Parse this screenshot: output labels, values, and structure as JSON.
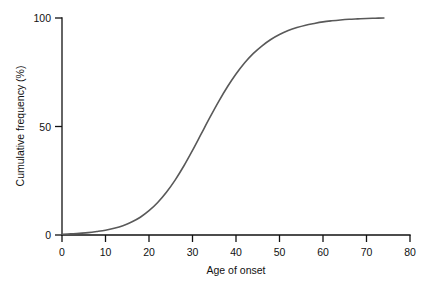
{
  "chart_data": {
    "type": "line",
    "title": "",
    "xlabel": "Age of onset",
    "ylabel": "Cumulative frequency (%)",
    "xlim": [
      0,
      80
    ],
    "ylim": [
      0,
      100
    ],
    "xticks": [
      0,
      10,
      20,
      30,
      40,
      50,
      60,
      70,
      80
    ],
    "xticklabels": [
      "0",
      "10",
      "20",
      "30",
      "40",
      "50",
      "60",
      "70",
      "80"
    ],
    "yticks": [
      0,
      50,
      100
    ],
    "yticklabels": [
      "0",
      "50",
      "100"
    ],
    "grid": false,
    "legend": false,
    "series": [
      {
        "name": "Cumulative frequency",
        "color": "#595959",
        "x": [
          0,
          2,
          4,
          6,
          8,
          10,
          12,
          14,
          16,
          18,
          20,
          22,
          24,
          26,
          28,
          30,
          32,
          34,
          36,
          38,
          40,
          42,
          44,
          46,
          48,
          50,
          52,
          54,
          56,
          58,
          60,
          62,
          64,
          66,
          68,
          70,
          72,
          74
        ],
        "y": [
          0.3,
          0.5,
          0.8,
          1.1,
          1.6,
          2.2,
          3.1,
          4.3,
          6.0,
          8.2,
          11.2,
          15.0,
          19.7,
          25.3,
          31.8,
          39.0,
          46.6,
          54.2,
          61.5,
          68.2,
          74.2,
          79.4,
          83.7,
          87.2,
          90.1,
          92.4,
          94.2,
          95.6,
          96.7,
          97.5,
          98.2,
          98.7,
          99.1,
          99.4,
          99.6,
          99.8,
          99.9,
          100.0
        ]
      }
    ],
    "annotations": []
  },
  "axis_colors": {
    "axis": "#111111",
    "curve": "#595959",
    "background": "#ffffff"
  }
}
